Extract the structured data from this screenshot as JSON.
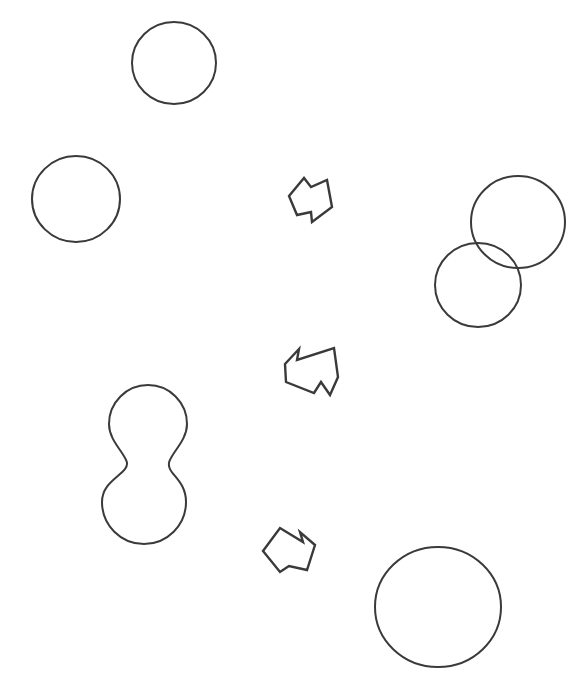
{
  "canvas": {
    "width": 585,
    "height": 693,
    "background_color": "#ffffff",
    "stroke_color": "#3a3a3a",
    "stroke_width": 2
  },
  "figure": {
    "kind": "line-drawing",
    "shape_count": 9,
    "arrow_count": 3
  },
  "shapes": [
    {
      "id": "circle-top-center",
      "name": "circle",
      "cx": 174,
      "cy": 63,
      "rx": 42,
      "ry": 41,
      "label": "Circle 1"
    },
    {
      "id": "circle-left-upper",
      "name": "circle",
      "cx": 76,
      "cy": 199,
      "rx": 44,
      "ry": 43,
      "label": "Circle 2"
    },
    {
      "id": "circle-right-large",
      "name": "circle",
      "cx": 518,
      "cy": 222,
      "rx": 47,
      "ry": 46,
      "label": "Circle 3"
    },
    {
      "id": "circle-right-small",
      "name": "circle",
      "cx": 478,
      "cy": 285,
      "rx": 43,
      "ry": 42,
      "label": "Circle 4"
    },
    {
      "id": "circle-bottom-right-large",
      "name": "circle",
      "cx": 438,
      "cy": 607,
      "rx": 63,
      "ry": 60,
      "label": "Circle 5"
    }
  ],
  "blobs": [
    {
      "id": "peanut-blob-left",
      "name": "peanut-blob",
      "lobe_top": {
        "cx": 148,
        "cy": 424,
        "r": 39
      },
      "lobe_bottom": {
        "cx": 144,
        "cy": 502,
        "r": 42
      },
      "waist_y": 462,
      "label": "Peanut blob"
    }
  ],
  "arrows": [
    {
      "id": "arrow-top",
      "name": "arrow",
      "direction": "right",
      "points": "289,196 304,178 311,187 327,180 332,207 312,222 311,212 297,215",
      "label": "Arrow 1"
    },
    {
      "id": "arrow-middle",
      "name": "arrow",
      "direction": "left",
      "points": "285,364 299,349 297,360 334,348 338,377 330,395 321,382 314,393 286,382",
      "label": "Arrow 2"
    },
    {
      "id": "arrow-bottom",
      "name": "arrow",
      "direction": "right",
      "points": "263,551 280,528 303,542 300,532 315,545 307,570 289,566 280,572",
      "label": "Arrow 3"
    }
  ]
}
